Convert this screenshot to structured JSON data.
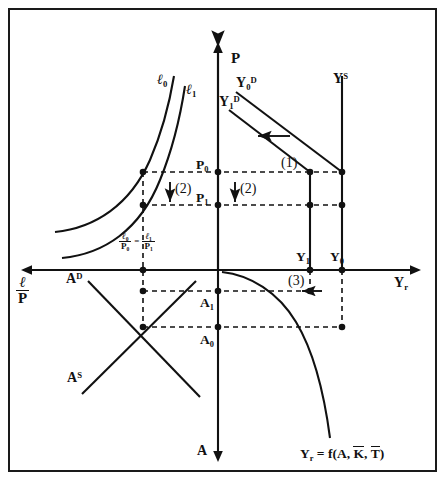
{
  "figure": {
    "kind": "four-quadrant-macro-diagram",
    "title_visible": false,
    "border_color": "#1a1a1a",
    "ink_color": "#111111",
    "background": "#ffffff",
    "width": 446,
    "height": 492
  },
  "axes": {
    "p_axis_label": "P",
    "yr_axis_label_main": "Y",
    "yr_axis_label_sub": "r",
    "lp_axis_numerator": "ℓ",
    "lp_axis_denominator": "P",
    "a_axis_label": "A",
    "origin_x": 218,
    "origin_y": 270
  },
  "curves": {
    "l0_label": "ℓ",
    "l0_sub": "0",
    "l1_label": "ℓ",
    "l1_sub": "1",
    "yd0_label": "Y",
    "yd0_sub": "0",
    "yd0_sup": "D",
    "yd1_label": "Y",
    "yd1_sub": "1",
    "yd1_sup": "D",
    "ys_label": "Y",
    "ys_sup": "S",
    "ad_label": "A",
    "ad_sup": "D",
    "as_label": "A",
    "as_sup": "S",
    "production_function": {
      "lhs": "Y",
      "lhs_sub": "r",
      "eq": " = f(A, ",
      "k_bar": "K",
      "comma": ", ",
      "t_bar": "T",
      "close": ")"
    }
  },
  "points": {
    "p0_label": "P",
    "p0_sub": "0",
    "p1_label": "P",
    "p1_sub": "1",
    "y0_label": "Y",
    "y0_sub": "0",
    "y1_label": "Y",
    "y1_sub": "1",
    "a0_label": "A",
    "a0_sub": "0",
    "a1_label": "A",
    "a1_sub": "1",
    "real_wage_equality": {
      "left_num": "ℓ",
      "left_num_sub": "0",
      "left_den": "P",
      "left_den_sub": "0",
      "equals": "=",
      "right_num": "ℓ",
      "right_num_sub": "1",
      "right_den": "P",
      "right_den_sub": "1"
    }
  },
  "annotations": {
    "step1": "(1)",
    "step2_left": "(2)",
    "step2_right": "(2)",
    "step3": "(3)"
  }
}
